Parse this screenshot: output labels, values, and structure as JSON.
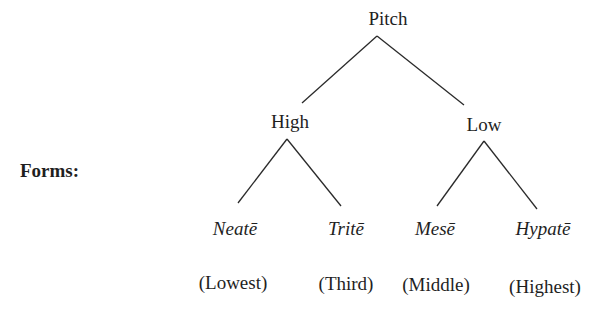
{
  "diagram": {
    "type": "tree",
    "side_label": "Forms:",
    "root": {
      "id": "pitch",
      "label": "Pitch"
    },
    "branches": [
      {
        "id": "high",
        "label": "High"
      },
      {
        "id": "low",
        "label": "Low"
      }
    ],
    "leaves": [
      {
        "id": "neate",
        "parent": "high",
        "name": "Neatē",
        "gloss": "(Lowest)"
      },
      {
        "id": "trite",
        "parent": "high",
        "name": "Tritē",
        "gloss": "(Third)"
      },
      {
        "id": "mese",
        "parent": "low",
        "name": "Mesē",
        "gloss": "(Middle)"
      },
      {
        "id": "hypate",
        "parent": "low",
        "name": "Hypatē",
        "gloss": "(Highest)"
      }
    ],
    "edges": [
      [
        "pitch",
        "high"
      ],
      [
        "pitch",
        "low"
      ],
      [
        "high",
        "neate"
      ],
      [
        "high",
        "trite"
      ],
      [
        "low",
        "mese"
      ],
      [
        "low",
        "hypate"
      ]
    ],
    "line_color": "#2a2a2a"
  }
}
